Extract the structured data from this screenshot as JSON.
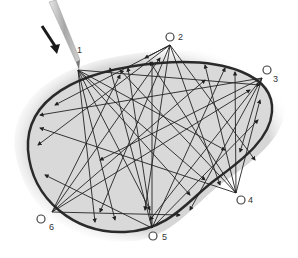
{
  "diagram": {
    "colors": {
      "area_fill": "#d9d9d9",
      "outline": "#2a2a2a",
      "lines": "#222222",
      "needle": "#bdbdbd",
      "arrow": "#1a1a1a"
    },
    "points": [
      {
        "id": 1,
        "label": "1"
      },
      {
        "id": 2,
        "label": "2"
      },
      {
        "id": 3,
        "label": "3"
      },
      {
        "id": 4,
        "label": "4"
      },
      {
        "id": 5,
        "label": "5"
      },
      {
        "id": 6,
        "label": "6"
      }
    ]
  }
}
